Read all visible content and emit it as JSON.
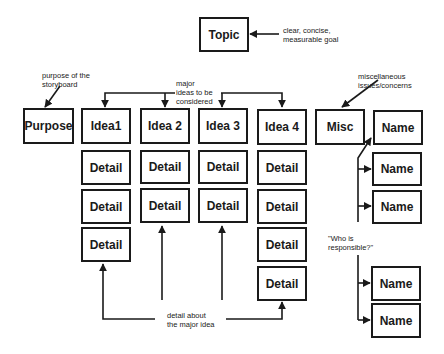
{
  "diagram": {
    "type": "storyboard-structure",
    "topic": {
      "label": "Topic",
      "annotation": [
        "clear, concise,",
        "measurable goal"
      ]
    },
    "purpose": {
      "label": "Purpose",
      "annotation": [
        "purpose of the",
        "storyboard"
      ]
    },
    "ideas_annotation": [
      "major",
      "ideas to be",
      "considered"
    ],
    "ideas": [
      {
        "label": "Idea1",
        "details": [
          "Detail",
          "Detail",
          "Detail"
        ]
      },
      {
        "label": "Idea 2",
        "details": [
          "Detail",
          "Detail"
        ]
      },
      {
        "label": "Idea 3",
        "details": [
          "Detail",
          "Detail"
        ]
      },
      {
        "label": "Idea 4",
        "details": [
          "Detail",
          "Detail",
          "Detail",
          "Detail"
        ]
      }
    ],
    "details_annotation": [
      "detail about",
      "the major idea"
    ],
    "misc": {
      "label": "Misc",
      "annotation": [
        "miscellaneous",
        "issues/concerns"
      ]
    },
    "names": [
      "Name",
      "Name",
      "Name",
      "Name",
      "Name"
    ],
    "names_annotation": [
      "\"Who is",
      "responsible?\""
    ]
  }
}
